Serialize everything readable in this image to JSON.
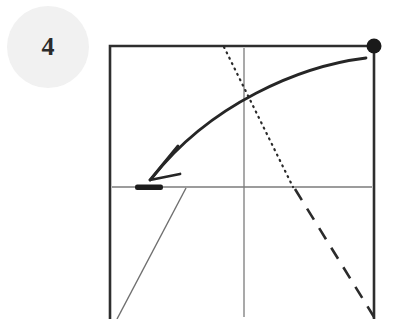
{
  "diagram": {
    "kind": "origami-fold-step",
    "step_number": "4",
    "background_color": "#ffffff",
    "canvas": {
      "width": 400,
      "height": 319
    },
    "step_badge": {
      "label": "4",
      "shape": "circle",
      "fill_color": "#f1f1f1",
      "text_color": "#2b2b2b",
      "center": {
        "x": 48,
        "y": 47
      },
      "radius": 41
    },
    "paper": {
      "name": "square-paper-outline",
      "stroke_color": "#2e2e2e",
      "stroke_width": 2.6,
      "left": 110,
      "top": 46,
      "right": 374,
      "bottom": 319,
      "note": "bottom edge extends past the visible canvas"
    },
    "creases": [
      {
        "name": "horizontal-center-crease",
        "style": "solid-thin",
        "stroke_color": "#7b7b7b",
        "stroke_width": 1.3,
        "x1": 112,
        "y1": 187,
        "x2": 372,
        "y2": 187
      },
      {
        "name": "vertical-center-crease",
        "style": "solid-thin",
        "stroke_color": "#7b7b7b",
        "stroke_width": 1.3,
        "x1": 244,
        "y1": 48,
        "x2": 244,
        "y2": 317
      },
      {
        "name": "lower-left-diagonal-crease",
        "style": "solid-thin",
        "stroke_color": "#6f6f6f",
        "stroke_width": 1.4,
        "x1": 186,
        "y1": 188,
        "x2": 117,
        "y2": 319
      }
    ],
    "dotted_line": {
      "name": "dotted-reference-line",
      "style": "dotted",
      "stroke_color": "#2b2b2b",
      "stroke_width": 2.2,
      "dash_pattern": "1 5",
      "x1": 224,
      "y1": 47,
      "x2": 293,
      "y2": 187
    },
    "dashed_line": {
      "name": "dashed-fold-line",
      "style": "dashed",
      "stroke_color": "#2b2b2b",
      "stroke_width": 2.6,
      "dash_pattern": "13 10",
      "x1": 295,
      "y1": 189,
      "x2": 374,
      "y2": 317
    },
    "corner_dot": {
      "name": "corner-reference-dot",
      "fill_color": "#1a1a1a",
      "center": {
        "x": 374,
        "y": 46
      },
      "radius": 7.5
    },
    "edge_marker": {
      "name": "thick-edge-marker",
      "fill_color": "#1c1c1c",
      "x": 135,
      "y": 184.5,
      "width": 28,
      "height": 5.5
    },
    "fold_arrow": {
      "name": "curved-fold-arrow",
      "stroke_color": "#262626",
      "stroke_width": 2.8,
      "direction": "right-to-left",
      "path": "M 366 58 C 300 66, 210 104, 152 178",
      "head": {
        "tip": {
          "x": 150,
          "y": 180
        },
        "barb_a": {
          "x": 178,
          "y": 146
        },
        "barb_b": {
          "x": 180,
          "y": 174
        }
      }
    }
  }
}
